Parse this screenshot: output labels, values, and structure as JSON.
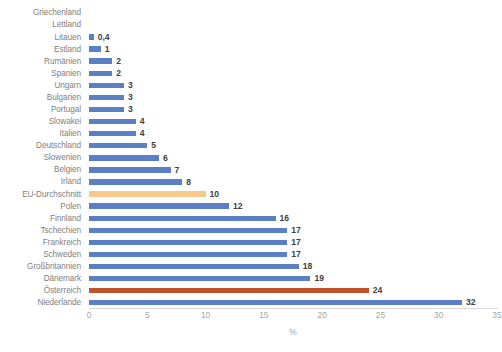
{
  "chart_data": {
    "type": "bar",
    "orientation": "horizontal",
    "title": "",
    "xlabel": "%",
    "ylabel": "",
    "xlim": [
      0,
      35
    ],
    "xticks": [
      0,
      5,
      10,
      15,
      20,
      25,
      30,
      35
    ],
    "grid": false,
    "legend": "none",
    "categories": [
      "Griechenland",
      "Lettland",
      "Litauen",
      "Estland",
      "Rumänien",
      "Spanien",
      "Ungarn",
      "Bulgarien",
      "Portugal",
      "Slowakei",
      "Italien",
      "Deutschland",
      "Slowenien",
      "Belgien",
      "Irland",
      "EU-Durchschnitt",
      "Polen",
      "Finnland",
      "Tschechien",
      "Frankreich",
      "Schweden",
      "Großbritannien",
      "Dänemark",
      "Österreich",
      "Niederlande"
    ],
    "values": [
      0,
      0,
      0.4,
      1,
      2,
      2,
      3,
      3,
      3,
      4,
      4,
      5,
      6,
      7,
      8,
      10,
      12,
      16,
      17,
      17,
      17,
      18,
      19,
      24,
      32
    ],
    "value_labels": [
      "",
      "",
      "0,4",
      "1",
      "2",
      "2",
      "3",
      "3",
      "3",
      "4",
      "4",
      "5",
      "6",
      "7",
      "8",
      "10",
      "12",
      "16",
      "17",
      "17",
      "17",
      "18",
      "19",
      "24",
      "32"
    ],
    "bar_styles": [
      "default",
      "default",
      "default",
      "default",
      "default",
      "default",
      "default",
      "default",
      "default",
      "default",
      "default",
      "default",
      "default",
      "default",
      "default",
      "avg",
      "default",
      "default",
      "default",
      "default",
      "default",
      "default",
      "default",
      "highlight",
      "default"
    ],
    "colors": {
      "default": "#5b7fc4",
      "avg": "#f5c98a",
      "highlight": "#c0532a",
      "category_label": "#808080",
      "tick_label": "#a6a6a6",
      "value_label": "#3f3f3f",
      "axis_line": "#d9d9d9",
      "background": "#ffffff"
    }
  }
}
